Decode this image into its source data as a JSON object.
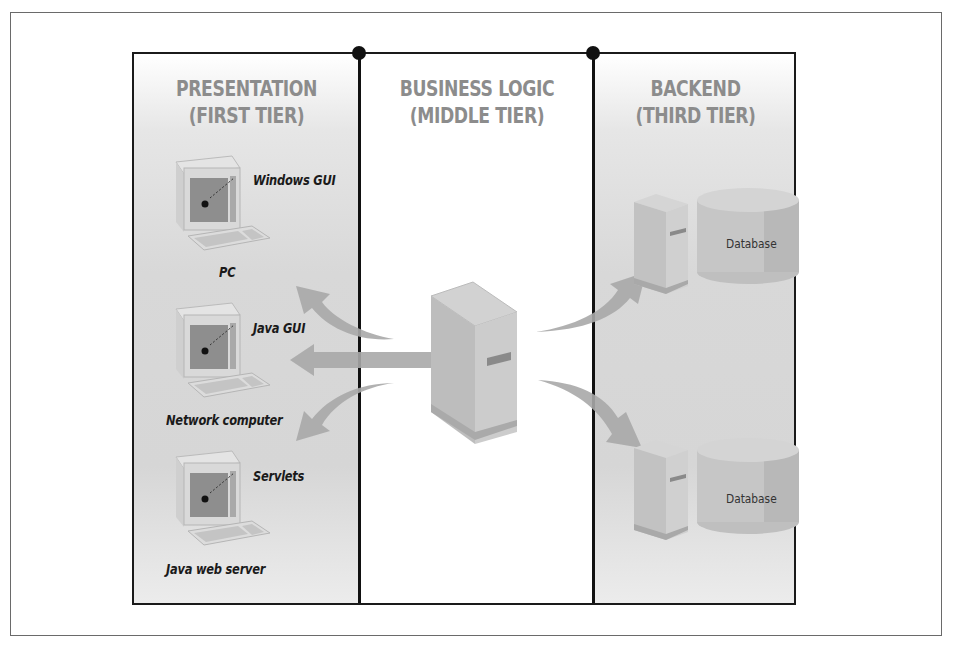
{
  "diagram": {
    "tiers": [
      {
        "title_line1": "PRESENTATION",
        "title_line2": "(FIRST TIER)"
      },
      {
        "title_line1": "BUSINESS LOGIC",
        "title_line2": "(MIDDLE TIER)"
      },
      {
        "title_line1": "BACKEND",
        "title_line2": "(THIRD TIER)"
      }
    ],
    "clients": [
      {
        "callout": "Windows GUI",
        "caption": "PC"
      },
      {
        "callout": "Java GUI",
        "caption": "Network computer"
      },
      {
        "callout": "Servlets",
        "caption": "Java web server"
      }
    ],
    "middle": {
      "node": "application-server"
    },
    "backends": [
      {
        "label": "Database"
      },
      {
        "label": "Database"
      }
    ],
    "colors": {
      "border": "#111111",
      "tier_title": "#8c8c8c",
      "panel_shade": "#d8d8d8",
      "arrow": "#a8a8a8",
      "device": "#c9c9c9"
    }
  }
}
